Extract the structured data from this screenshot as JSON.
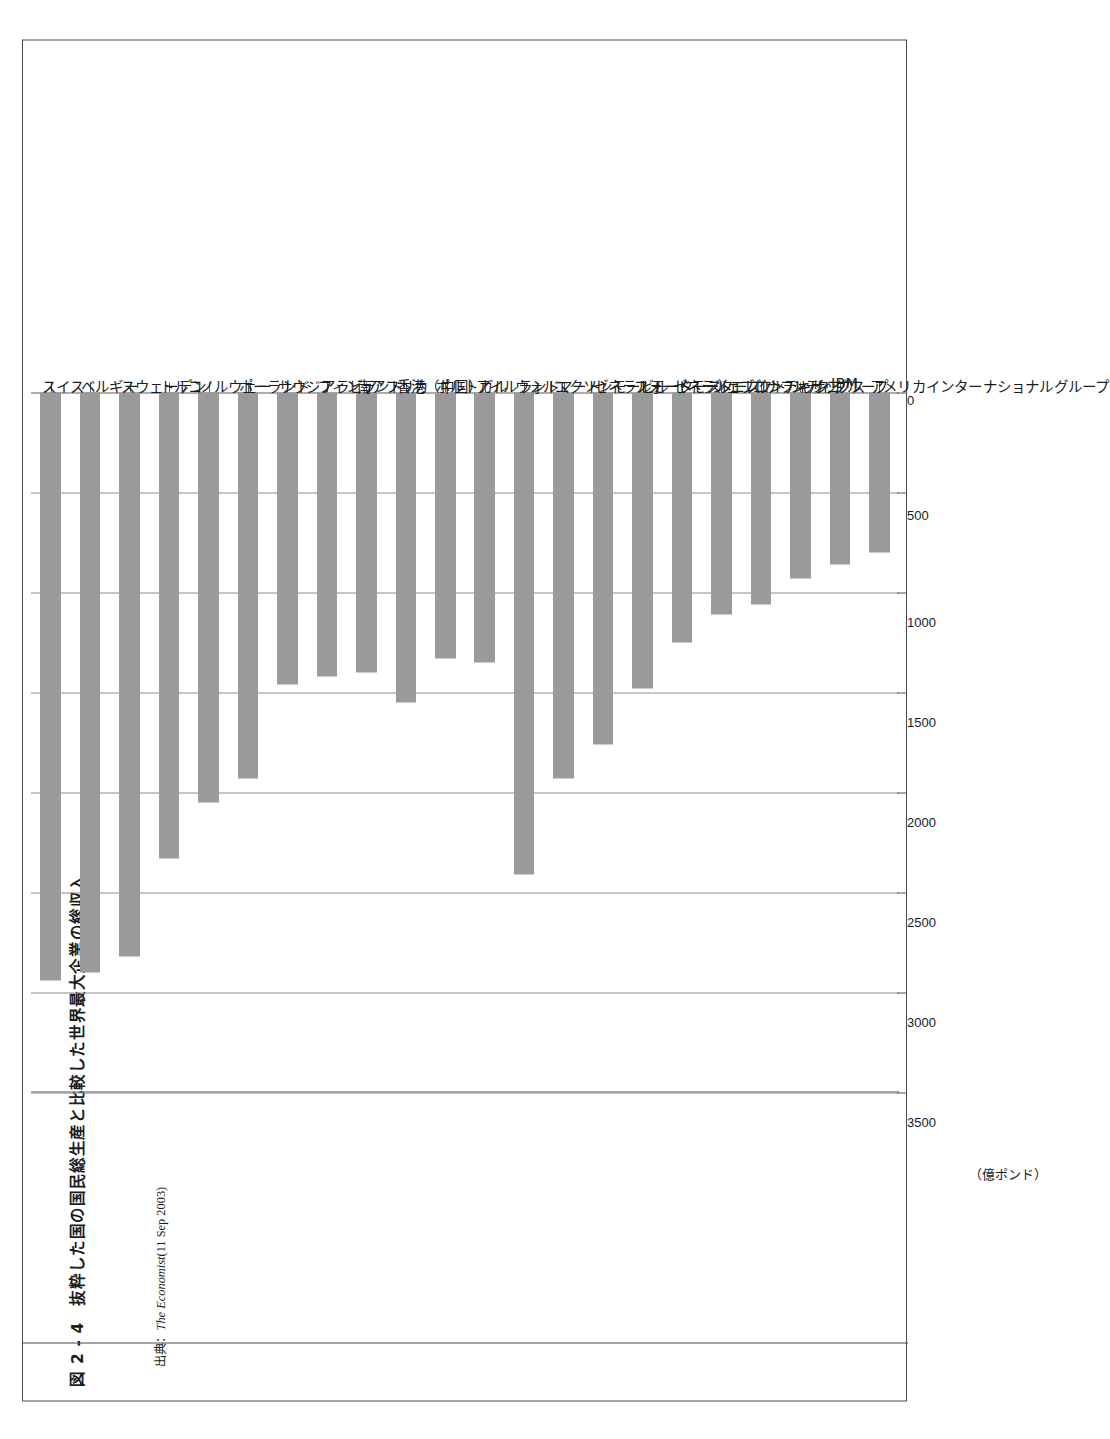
{
  "figure": {
    "number": "図 2 - 4",
    "caption": "図 2 - 4　抜粋した国の国民総生産と比較した世界最大企業の総収入",
    "source_prefix": "出典：",
    "source_name": "The Economist",
    "source_date": "(11 Sep 2003)"
  },
  "chart_data": {
    "type": "bar",
    "orientation": "horizontal",
    "title": "抜粋した国の国民総生産と比較した世界最大企業の総収入",
    "xlabel": "（億ポンド）",
    "ylabel": "",
    "xlim": [
      0,
      3500
    ],
    "xticks": [
      0,
      500,
      1000,
      1500,
      2000,
      2500,
      3000,
      3500
    ],
    "xticklabels": [
      "0",
      "500",
      "1000",
      "1500",
      "2000",
      "2500",
      "3000",
      "3500"
    ],
    "unit_label": "（億ポンド）",
    "grid": true,
    "legend": "none",
    "bar_color": "#9a9a9a",
    "categories": [
      "スイス",
      "ベルギー",
      "スウェーデン",
      "トルコ",
      "ノルウェー",
      "ポーランド",
      "サウジアラビア",
      "フィンランド",
      "南アフリカ",
      "香港（中国）",
      "ポルトガル",
      "アイルランド",
      "ウォルマート",
      "エクソンモービル",
      "ゼネラルモーターズ",
      "フォードモーターズ",
      "ゼネラルエレクトリック",
      "シェブロンテキサコ",
      "コナフィリップス",
      "シティグループ",
      "IBM",
      "アメリカインターナショナルグループ"
    ],
    "values": [
      2940,
      2900,
      2820,
      2330,
      2050,
      1930,
      1460,
      1420,
      1400,
      1550,
      1330,
      1350,
      2410,
      1930,
      1760,
      1480,
      1250,
      1110,
      1060,
      930,
      860,
      800
    ]
  }
}
